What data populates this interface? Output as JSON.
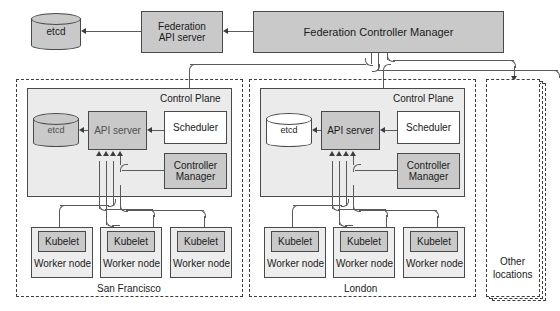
{
  "federation": {
    "etcd": "etcd",
    "api_server": "Federation\nAPI server",
    "api_server_line1": "Federation",
    "api_server_line2": "API server",
    "controller_manager": "Federation Controller Manager"
  },
  "clusters": [
    {
      "name": "San Francisco",
      "control_plane_label": "Control Plane",
      "etcd": "etcd",
      "api_server": "API server",
      "scheduler": "Scheduler",
      "controller_manager_line1": "Controller",
      "controller_manager_line2": "Manager",
      "nodes": [
        {
          "kubelet": "Kubelet",
          "node": "Worker node"
        },
        {
          "kubelet": "Kubelet",
          "node": "Worker node"
        },
        {
          "kubelet": "Kubelet",
          "node": "Worker node"
        }
      ]
    },
    {
      "name": "London",
      "control_plane_label": "Control Plane",
      "etcd": "etcd",
      "api_server": "API server",
      "scheduler": "Scheduler",
      "controller_manager_line1": "Controller",
      "controller_manager_line2": "Manager",
      "nodes": [
        {
          "kubelet": "Kubelet",
          "node": "Worker node"
        },
        {
          "kubelet": "Kubelet",
          "node": "Worker node"
        },
        {
          "kubelet": "Kubelet",
          "node": "Worker node"
        }
      ]
    }
  ],
  "other_locations": {
    "line1": "Other",
    "line2": "locations"
  },
  "colors": {
    "component_fill": "#c9c9c9",
    "plain_fill": "#ffffff",
    "plane_fill": "#ebebeb",
    "node_fill": "#ededed",
    "stroke": "#4a4a4a",
    "connector": "#5a5a5a"
  }
}
